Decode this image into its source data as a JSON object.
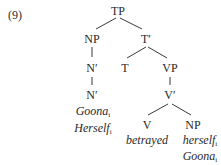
{
  "example_number": "(9)",
  "nodes": {
    "tp": "TP",
    "np_subject": "NP",
    "t_bar": "T′",
    "n_bar_1": "N′",
    "n_bar_2": "N′",
    "t": "T",
    "vp": "VP",
    "v_bar": "V′",
    "v": "V",
    "np_object": "NP"
  },
  "terminals": {
    "subject": [
      {
        "word": "Goona",
        "index": "i"
      },
      {
        "word": "Herself",
        "index": "i"
      }
    ],
    "verb": "betrayed",
    "object": [
      {
        "word": "herself",
        "index": "i"
      },
      {
        "word": "Goona",
        "index": "i"
      }
    ]
  }
}
